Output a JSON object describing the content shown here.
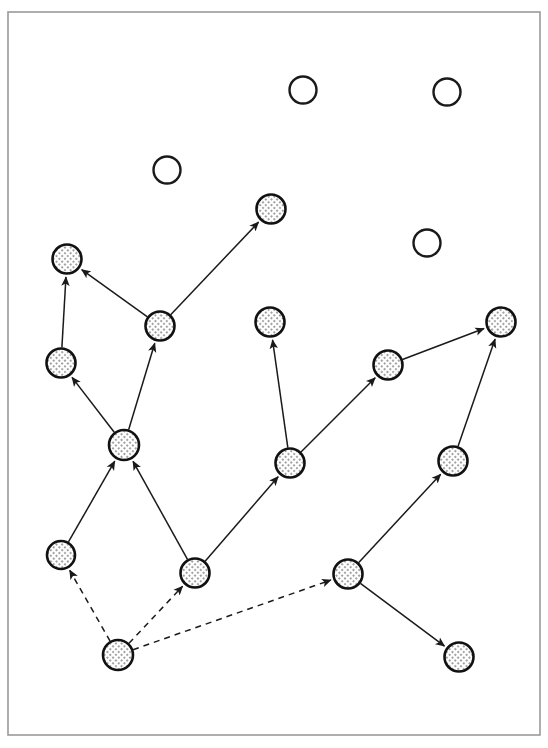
{
  "figure": {
    "background_color": "#ffffff",
    "frame": {
      "label": "figure-border",
      "x": 8,
      "y": 12,
      "width": 532,
      "height": 723,
      "stroke_color": "#9a9a9a",
      "stroke_width": 1.6
    },
    "style": {
      "node_radius_filled": 14.5,
      "node_radius_empty": 13.5,
      "filled_node_border_color": "#111111",
      "filled_node_fill_color": "#e8e8e8",
      "filled_node_pattern": "fine diagonal crosshatch dots",
      "empty_node_border_color": "#1a1a1a",
      "empty_node_fill_color": "#ffffff",
      "edge_color": "#1a1a1a",
      "edge_width": 1.5,
      "dash_pattern": "6 5",
      "arrowhead": "solid filled triangle"
    }
  },
  "chart_data": {
    "type": "scatter",
    "subtitle": "",
    "xlabel": "",
    "ylabel": "",
    "grid": false,
    "legend": null,
    "xlim": [
      8,
      540
    ],
    "ylim": [
      12,
      735
    ],
    "node_count": 19,
    "filled_node_count": 15,
    "empty_node_count": 4,
    "edge_count": 17,
    "solid_edge_count": 14,
    "dashed_edge_count": 3,
    "nodes": [
      {
        "id": "n1",
        "x": 303,
        "y": 90,
        "r": 13.5,
        "state": "empty",
        "label": ""
      },
      {
        "id": "n2",
        "x": 447,
        "y": 92,
        "r": 13.5,
        "state": "empty",
        "label": ""
      },
      {
        "id": "n3",
        "x": 167,
        "y": 170,
        "r": 13.5,
        "state": "empty",
        "label": ""
      },
      {
        "id": "n4",
        "x": 427,
        "y": 243,
        "r": 13.5,
        "state": "empty",
        "label": ""
      },
      {
        "id": "n5",
        "x": 271,
        "y": 209,
        "r": 14.5,
        "state": "filled",
        "label": ""
      },
      {
        "id": "n6",
        "x": 67,
        "y": 259,
        "r": 14.5,
        "state": "filled",
        "label": ""
      },
      {
        "id": "n7",
        "x": 160,
        "y": 326,
        "r": 14.5,
        "state": "filled",
        "label": ""
      },
      {
        "id": "n8",
        "x": 270,
        "y": 322,
        "r": 14.5,
        "state": "filled",
        "label": ""
      },
      {
        "id": "n9",
        "x": 501,
        "y": 322,
        "r": 14.5,
        "state": "filled",
        "label": ""
      },
      {
        "id": "n10",
        "x": 61,
        "y": 363,
        "r": 14.5,
        "state": "filled",
        "label": ""
      },
      {
        "id": "n11",
        "x": 388,
        "y": 365,
        "r": 14.5,
        "state": "filled",
        "label": ""
      },
      {
        "id": "n12",
        "x": 124,
        "y": 445,
        "r": 15.0,
        "state": "filled",
        "label": ""
      },
      {
        "id": "n13",
        "x": 290,
        "y": 463,
        "r": 14.5,
        "state": "filled",
        "label": ""
      },
      {
        "id": "n14",
        "x": 453,
        "y": 461,
        "r": 14.5,
        "state": "filled",
        "label": ""
      },
      {
        "id": "n15",
        "x": 61,
        "y": 555,
        "r": 14.0,
        "state": "filled",
        "label": ""
      },
      {
        "id": "n16",
        "x": 195,
        "y": 573,
        "r": 14.5,
        "state": "filled",
        "label": ""
      },
      {
        "id": "n17",
        "x": 348,
        "y": 574,
        "r": 14.5,
        "state": "filled",
        "label": ""
      },
      {
        "id": "n18",
        "x": 118,
        "y": 655,
        "r": 15.0,
        "state": "filled",
        "label": ""
      },
      {
        "id": "n19",
        "x": 459,
        "y": 657,
        "r": 14.5,
        "state": "filled",
        "label": ""
      }
    ],
    "edges": [
      {
        "from": "n7",
        "to": "n6",
        "style": "solid",
        "directed": true
      },
      {
        "from": "n7",
        "to": "n5",
        "style": "solid",
        "directed": true
      },
      {
        "from": "n10",
        "to": "n6",
        "style": "solid",
        "directed": true
      },
      {
        "from": "n12",
        "to": "n10",
        "style": "solid",
        "directed": true
      },
      {
        "from": "n12",
        "to": "n7",
        "style": "solid",
        "directed": true
      },
      {
        "from": "n15",
        "to": "n12",
        "style": "solid",
        "directed": true
      },
      {
        "from": "n16",
        "to": "n12",
        "style": "solid",
        "directed": true
      },
      {
        "from": "n13",
        "to": "n8",
        "style": "solid",
        "directed": true
      },
      {
        "from": "n16",
        "to": "n13",
        "style": "solid",
        "directed": true
      },
      {
        "from": "n13",
        "to": "n11",
        "style": "solid",
        "directed": true
      },
      {
        "from": "n11",
        "to": "n9",
        "style": "solid",
        "directed": true
      },
      {
        "from": "n14",
        "to": "n9",
        "style": "solid",
        "directed": true
      },
      {
        "from": "n17",
        "to": "n14",
        "style": "solid",
        "directed": true
      },
      {
        "from": "n17",
        "to": "n19",
        "style": "solid",
        "directed": true
      },
      {
        "from": "n18",
        "to": "n15",
        "style": "dashed",
        "directed": true
      },
      {
        "from": "n18",
        "to": "n16",
        "style": "dashed",
        "directed": true
      },
      {
        "from": "n18",
        "to": "n17",
        "style": "dashed",
        "directed": true
      }
    ]
  }
}
